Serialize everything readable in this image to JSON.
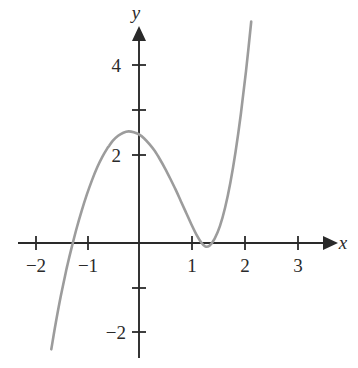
{
  "chart_data": {
    "type": "line",
    "title": "",
    "subtitle": "",
    "xlabel": "x",
    "ylabel": "y",
    "xlim": [
      -2.35,
      3.45
    ],
    "ylim": [
      -2.85,
      4.8
    ],
    "grid": false,
    "legend": false,
    "legend_position": "none",
    "x_ticks": [
      -2,
      -1,
      1,
      2,
      3
    ],
    "x_tick_labels": [
      "−2",
      "−1",
      "1",
      "2",
      "3"
    ],
    "y_ticks": [
      -2,
      -1,
      1,
      2,
      3,
      4
    ],
    "y_tick_labels": [
      "−2",
      "",
      "",
      "2",
      "",
      "4"
    ],
    "y_labeled_ticks": [
      {
        "value": 4,
        "label": "4"
      },
      {
        "value": 2,
        "label": "2"
      },
      {
        "value": -2,
        "label": "−2"
      }
    ],
    "series": [
      {
        "name": "cubic",
        "color": "#9c9c9c",
        "line_width": 2.6,
        "x_domain": [
          -1.68,
          2.36
        ],
        "y_intercept": 2.0,
        "x_roots": [
          -1.37,
          1.0
        ],
        "double_root": 1.0,
        "local_maximum": {
          "x": -0.58,
          "y": 2.62
        },
        "local_minimum": {
          "x": 1.27,
          "y": -0.16
        },
        "endpoint_left": {
          "x": -1.68,
          "y": -2.4
        },
        "endpoint_right": {
          "x": 2.36,
          "y": 4.32
        },
        "equation": "y = 1.46(x − 1)²(x + 1.37)",
        "points": [
          [
            -1.68,
            -2.4
          ],
          [
            -1.6,
            -1.84
          ],
          [
            -1.5,
            -1.21
          ],
          [
            -1.4,
            -0.65
          ],
          [
            -1.37,
            -0.49
          ],
          [
            -1.3,
            -0.15
          ],
          [
            -1.2,
            0.31
          ],
          [
            -1.1,
            0.72
          ],
          [
            -1.0,
            1.09
          ],
          [
            -0.9,
            1.42
          ],
          [
            -0.8,
            1.71
          ],
          [
            -0.7,
            1.95
          ],
          [
            -0.6,
            2.15
          ],
          [
            -0.58,
            2.18
          ],
          [
            -0.5,
            2.31
          ],
          [
            -0.4,
            2.42
          ],
          [
            -0.3,
            2.49
          ],
          [
            -0.2,
            2.52
          ],
          [
            -0.1,
            2.5
          ],
          [
            0.0,
            2.45
          ],
          [
            0.1,
            2.36
          ],
          [
            0.2,
            2.23
          ],
          [
            0.3,
            2.08
          ],
          [
            0.4,
            1.89
          ],
          [
            0.5,
            1.68
          ],
          [
            0.6,
            1.45
          ],
          [
            0.7,
            1.21
          ],
          [
            0.8,
            0.95
          ],
          [
            0.9,
            0.69
          ],
          [
            1.0,
            0.43
          ],
          [
            1.1,
            0.19
          ],
          [
            1.2,
            0.0
          ],
          [
            1.27,
            -0.08
          ],
          [
            1.35,
            -0.06
          ],
          [
            1.45,
            0.1
          ],
          [
            1.55,
            0.38
          ],
          [
            1.65,
            0.8
          ],
          [
            1.75,
            1.36
          ],
          [
            1.85,
            2.06
          ],
          [
            1.95,
            2.9
          ],
          [
            2.05,
            3.88
          ],
          [
            2.15,
            5.0
          ],
          [
            2.25,
            6.26
          ],
          [
            2.36,
            7.79
          ]
        ]
      }
    ],
    "axes": {
      "x_axis_color": "#2a2a2a",
      "y_axis_color": "#2a2a2a",
      "arrowheads": [
        "x-positive",
        "y-positive"
      ],
      "origin_label": ""
    },
    "colors": {
      "background": "#ffffff",
      "curve": "#9c9c9c",
      "axis": "#2a2a2a",
      "text": "#2a2a2a"
    }
  }
}
